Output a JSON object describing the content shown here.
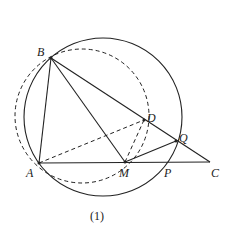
{
  "figure": {
    "caption": "(1)",
    "points": {
      "A": {
        "label": "A",
        "x": 39,
        "y": 163
      },
      "B": {
        "label": "B",
        "x": 51,
        "y": 58
      },
      "M": {
        "label": "M",
        "x": 125,
        "y": 162
      },
      "C": {
        "label": "C",
        "x": 210,
        "y": 162
      },
      "D": {
        "label": "D",
        "x": 144,
        "y": 120
      },
      "Q": {
        "label": "Q",
        "x": 176,
        "y": 141
      },
      "P": {
        "label": "P",
        "x": 167,
        "y": 162
      }
    },
    "circles": [
      {
        "name": "solid-circle",
        "cx": 103,
        "cy": 117,
        "r": 79,
        "style": "solid"
      },
      {
        "name": "dashed-circle",
        "cx": 82,
        "cy": 116,
        "r": 67,
        "style": "dashed"
      }
    ],
    "solid_segments": [
      "AB",
      "BC",
      "BM",
      "AC",
      "MQ"
    ],
    "dashed_segments": [
      "AD",
      "MD"
    ]
  }
}
